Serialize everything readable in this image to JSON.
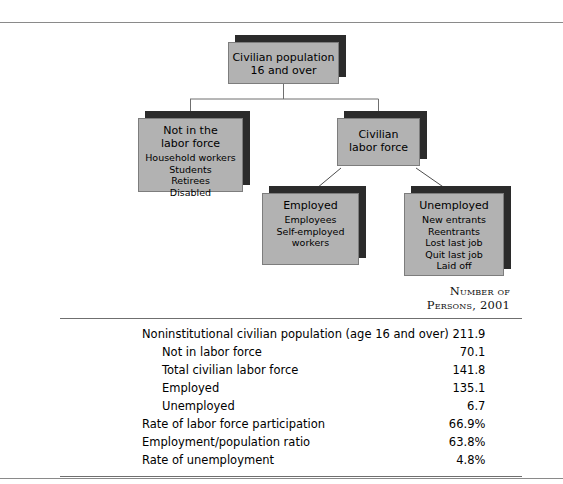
{
  "figure": {
    "flowchart": {
      "nodes": [
        {
          "id": "civilian-population",
          "title": "Civilian population\n16 and over",
          "title_line1": "Civilian population",
          "title_line2": "16 and over",
          "items": []
        },
        {
          "id": "not-in-labor-force",
          "title_line1": "Not in the",
          "title_line2": "labor force",
          "items": [
            "Household workers",
            "Students",
            "Retirees",
            "Disabled"
          ]
        },
        {
          "id": "civilian-labor-force",
          "title_line1": "Civilian",
          "title_line2": "labor force",
          "items": []
        },
        {
          "id": "employed",
          "title_line1": "Employed",
          "title_line2": "",
          "items": [
            "Employees",
            "Self-employed",
            "workers"
          ]
        },
        {
          "id": "unemployed",
          "title_line1": "Unemployed",
          "title_line2": "",
          "items": [
            "New entrants",
            "Reentrants",
            "Lost last job",
            "Quit last job",
            "Laid off"
          ]
        }
      ]
    },
    "table": {
      "column_header_line1": "Number of",
      "column_header_line2": "Persons, 2001",
      "rows": [
        {
          "label": "Noninstitutional civilian population (age 16 and over)",
          "value": "211.9",
          "indent": false
        },
        {
          "label": "Not in labor force",
          "value": "70.1",
          "indent": true
        },
        {
          "label": "Total civilian labor force",
          "value": "141.8",
          "indent": true
        },
        {
          "label": "Employed",
          "value": "135.1",
          "indent": true
        },
        {
          "label": "Unemployed",
          "value": "6.7",
          "indent": true
        },
        {
          "label": "Rate of labor force participation",
          "value": "66.9%",
          "indent": false
        },
        {
          "label": "Employment/population ratio",
          "value": "63.8%",
          "indent": false
        },
        {
          "label": "Rate of unemployment",
          "value": "4.8%",
          "indent": false
        }
      ]
    },
    "colors": {
      "box_fill": "#b2b2b2",
      "box_shadow": "#2b2b2b",
      "box_border": "#7d7d7d",
      "rule": "#8a8a8a",
      "background": "#ffffff"
    }
  }
}
